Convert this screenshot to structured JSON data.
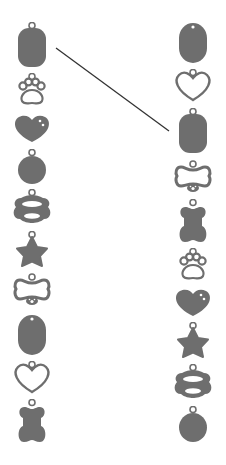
{
  "activity": {
    "type": "matching",
    "description": "Match identical pet tags between the left and right columns",
    "colors": {
      "shape": "#6e6e6e",
      "line": "#333333",
      "background": "#ffffff"
    }
  },
  "left_column": {
    "items": [
      {
        "shape": "rect-tag",
        "top": 22,
        "height": 46
      },
      {
        "shape": "paw-outline",
        "top": 73,
        "height": 34
      },
      {
        "shape": "heart-dots",
        "top": 113,
        "height": 30
      },
      {
        "shape": "circle-tag",
        "top": 149,
        "height": 36
      },
      {
        "shape": "bone-ring",
        "top": 189,
        "height": 38
      },
      {
        "shape": "star",
        "top": 231,
        "height": 38
      },
      {
        "shape": "bone-outline-paw",
        "top": 273,
        "height": 34
      },
      {
        "shape": "oval-tag",
        "top": 314,
        "height": 42
      },
      {
        "shape": "heart-outline",
        "top": 361,
        "height": 33
      },
      {
        "shape": "bone-filled",
        "top": 399,
        "height": 45
      }
    ]
  },
  "right_column": {
    "items": [
      {
        "shape": "oval-tag",
        "top": 22,
        "height": 42
      },
      {
        "shape": "heart-outline",
        "top": 69,
        "height": 33
      },
      {
        "shape": "rect-tag",
        "top": 108,
        "height": 46
      },
      {
        "shape": "bone-outline-paw",
        "top": 160,
        "height": 34
      },
      {
        "shape": "bone-filled",
        "top": 199,
        "height": 45
      },
      {
        "shape": "paw-outline",
        "top": 248,
        "height": 34
      },
      {
        "shape": "heart-dots",
        "top": 287,
        "height": 30
      },
      {
        "shape": "star",
        "top": 322,
        "height": 38
      },
      {
        "shape": "bone-ring",
        "top": 364,
        "height": 38
      },
      {
        "shape": "circle-tag",
        "top": 406,
        "height": 37
      }
    ]
  },
  "connections": [
    {
      "from": "left.0",
      "to": "right.2",
      "x1": 56,
      "y1": 48,
      "x2": 169,
      "y2": 131
    }
  ]
}
